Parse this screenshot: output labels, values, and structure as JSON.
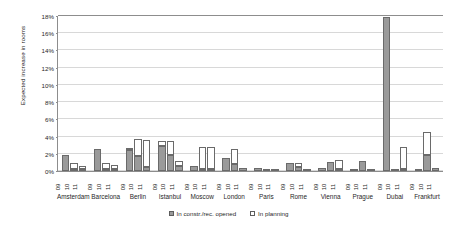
{
  "chart_data": {
    "type": "bar",
    "title": "",
    "subtitle": "",
    "xlabel": "",
    "ylabel": "Expected increase in rooms",
    "ylim": [
      0,
      18
    ],
    "ytick_labels": [
      "0%",
      "2%",
      "4%",
      "6%",
      "8%",
      "10%",
      "12%",
      "14%",
      "16%",
      "18%"
    ],
    "ytick_values": [
      0,
      2,
      4,
      6,
      8,
      10,
      12,
      14,
      16,
      18
    ],
    "grid": true,
    "stacked": true,
    "legend_position": "bottom-center",
    "categories": [
      "Amsterdam",
      "Barcelona",
      "Berlin",
      "Istanbul",
      "Moscow",
      "London",
      "Paris",
      "Rome",
      "Vienna",
      "Prague",
      "Dubai",
      "Frankfurt"
    ],
    "subcategories": [
      "09",
      "10",
      "11"
    ],
    "series": [
      {
        "name": "In constr./rec. opened",
        "color": "#9a9a9a",
        "values": [
          [
            1.9,
            0.1,
            0.1
          ],
          [
            2.6,
            0.1,
            0.1
          ],
          [
            2.4,
            1.8,
            0.5
          ],
          [
            2.9,
            1.9,
            0.6
          ],
          [
            0.6,
            0.1,
            0.1
          ],
          [
            1.5,
            0.8,
            0.4
          ],
          [
            0.3,
            0.2,
            0.2
          ],
          [
            0.9,
            0.5,
            0.1
          ],
          [
            0.3,
            1.1,
            0.1
          ],
          [
            0.1,
            1.2,
            0.2
          ],
          [
            18.0,
            0.1,
            0.1
          ],
          [
            0.2,
            1.9,
            0.3
          ]
        ]
      },
      {
        "name": "In planning",
        "color": "#ffffff",
        "values": [
          [
            0.0,
            0.7,
            0.4
          ],
          [
            0.0,
            0.7,
            0.5
          ],
          [
            0.3,
            1.9,
            3.1
          ],
          [
            0.6,
            1.6,
            0.6
          ],
          [
            0.0,
            2.5,
            2.6
          ],
          [
            0.0,
            1.8,
            0.0
          ],
          [
            0.0,
            0.0,
            0.0
          ],
          [
            0.0,
            0.4,
            0.0
          ],
          [
            0.0,
            0.0,
            1.0
          ],
          [
            0.0,
            0.0,
            0.0
          ],
          [
            0.0,
            0.0,
            2.6
          ],
          [
            0.0,
            2.6,
            0.0
          ]
        ]
      }
    ]
  },
  "legend": {
    "items": [
      {
        "label": "In constr./rec. opened",
        "swatch": "constr"
      },
      {
        "label": "In planning",
        "swatch": "planning"
      }
    ]
  }
}
